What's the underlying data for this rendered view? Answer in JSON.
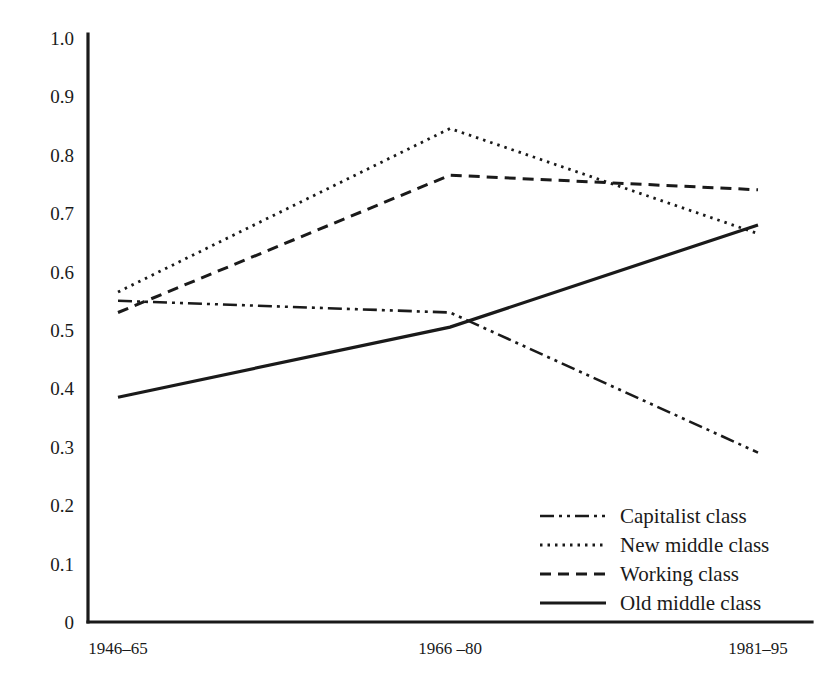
{
  "chart_data": {
    "type": "line",
    "title": "",
    "subtitle": "",
    "xlabel": "",
    "ylabel": "",
    "categories": [
      "1946–65",
      "1966 –80",
      "1981–95"
    ],
    "ylim": [
      0,
      1.0
    ],
    "y_ticks": [
      "0",
      "0.1",
      "0.2",
      "0.3",
      "0.4",
      "0.5",
      "0.6",
      "0.7",
      "0.8",
      "0.9",
      "1.0"
    ],
    "y_tick_values": [
      0,
      0.1,
      0.2,
      0.3,
      0.4,
      0.5,
      0.6,
      0.7,
      0.8,
      0.9,
      1.0
    ],
    "grid": false,
    "legend_position": "bottom-right",
    "series": [
      {
        "name": "Capitalist class",
        "style": "dash-dot-dot",
        "dasharray": "14,5,3,5,3,5",
        "width": 2.6,
        "color": "#1a1a1a",
        "values": [
          0.55,
          0.53,
          0.29
        ]
      },
      {
        "name": "New middle class",
        "style": "dotted",
        "dasharray": "2.5,5",
        "width": 2.8,
        "color": "#1a1a1a",
        "values": [
          0.565,
          0.845,
          0.665
        ]
      },
      {
        "name": "Working class",
        "style": "dashed",
        "dasharray": "11,7",
        "width": 3.0,
        "color": "#1a1a1a",
        "values": [
          0.53,
          0.765,
          0.74
        ]
      },
      {
        "name": "Old middle class",
        "style": "solid",
        "dasharray": "",
        "width": 3.2,
        "color": "#1a1a1a",
        "values": [
          0.385,
          0.505,
          0.68
        ]
      }
    ]
  },
  "axis": {
    "y_axis_name": "y-axis",
    "x_axis_name": "x-axis"
  },
  "legend": {
    "items": [
      {
        "label": "Capitalist class",
        "swatch": "dash-dot-dot-swatch-icon"
      },
      {
        "label": "New middle class",
        "swatch": "dotted-swatch-icon"
      },
      {
        "label": "Working class",
        "swatch": "dashed-swatch-icon"
      },
      {
        "label": "Old middle class",
        "swatch": "solid-swatch-icon"
      }
    ]
  },
  "colors": {
    "ink": "#1a1a1a",
    "background": "#ffffff"
  }
}
